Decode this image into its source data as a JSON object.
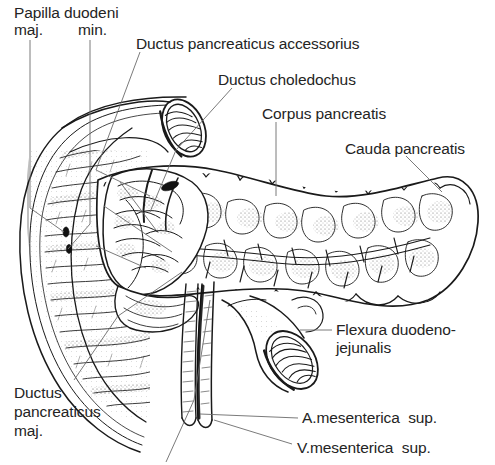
{
  "figure": {
    "kind": "anatomical-line-illustration",
    "style": "black ink line drawing with stipple shading on white background",
    "background_color": "#ffffff",
    "ink_color": "#1a1a1a",
    "leader_line_color": "#6b6b6b",
    "width": 495,
    "height": 465
  },
  "labels": [
    {
      "id": "papilla-duodeni",
      "line1": "Papilla duodeni",
      "line2": "",
      "x": 14,
      "y": 4,
      "align": "left"
    },
    {
      "id": "papilla-maj",
      "line1": "maj.",
      "line2": "",
      "x": 14,
      "y": 21,
      "align": "left"
    },
    {
      "id": "papilla-min",
      "line1": "min.",
      "line2": "",
      "x": 78,
      "y": 21,
      "align": "left"
    },
    {
      "id": "ductus-pancreaticus-accessorius",
      "line1": "Ductus pancreaticus accessorius",
      "line2": "",
      "x": 136,
      "y": 35,
      "align": "left"
    },
    {
      "id": "ductus-choledochus",
      "line1": "Ductus choledochus",
      "line2": "",
      "x": 218,
      "y": 71,
      "align": "left"
    },
    {
      "id": "corpus-pancreatis",
      "line1": "Corpus pancreatis",
      "line2": "",
      "x": 262,
      "y": 105,
      "align": "left"
    },
    {
      "id": "cauda-pancreatis",
      "line1": "Cauda pancreatis",
      "line2": "",
      "x": 345,
      "y": 140,
      "align": "left"
    },
    {
      "id": "flexura-duodenojejunalis",
      "line1": "Flexura duodeno-",
      "line2": "jejunalis",
      "x": 334,
      "y": 322,
      "align": "left"
    },
    {
      "id": "ductus-pancreaticus-maj",
      "line1": "Ductus",
      "line2": "pancreaticus",
      "line3": "maj.",
      "x": 14,
      "y": 385,
      "align": "left"
    },
    {
      "id": "a-mesenterica-sup",
      "line1": "A.mesenterica  sup.",
      "line2": "",
      "x": 300,
      "y": 410,
      "align": "left"
    },
    {
      "id": "v-mesenterica-sup",
      "line1": "V.mesenterica  sup.",
      "line2": "",
      "x": 295,
      "y": 440,
      "align": "left"
    }
  ],
  "structures": [
    {
      "id": "duodenum-descending",
      "name": "Descending duodenum, opened, showing plicae circulares"
    },
    {
      "id": "duodenum-cut-end",
      "name": "Cut end of superior duodenum with mucosal folds"
    },
    {
      "id": "pancreas-head",
      "name": "Caput pancreatis with dissected duct branches"
    },
    {
      "id": "pancreas-body",
      "name": "Corpus pancreatis, lobulated"
    },
    {
      "id": "pancreas-tail",
      "name": "Cauda pancreatis"
    },
    {
      "id": "jejunum-cut-end",
      "name": "Cut end of jejunum at duodenojejunal flexure"
    },
    {
      "id": "mesenteric-vessels",
      "name": "Superior mesenteric artery and vein descending"
    },
    {
      "id": "ductus-pancreaticus",
      "name": "Main pancreatic duct running through gland"
    }
  ]
}
